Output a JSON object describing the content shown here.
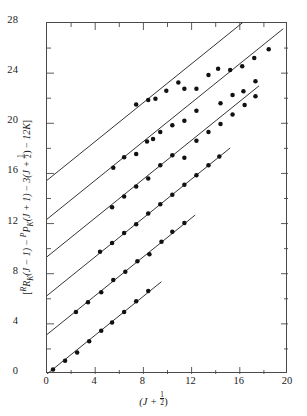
{
  "chart_data": {
    "type": "scatter",
    "title": "",
    "xlabel": "(J + 1/2)",
    "ylabel": "[ RR_K(J - 1) - PP_K(J + 1) - 3(J + 1/2) - 12K ]",
    "xlim": [
      0,
      20
    ],
    "ylim": [
      0,
      28
    ],
    "xticks": [
      0,
      4,
      8,
      12,
      16,
      20
    ],
    "yticks": [
      0,
      4,
      8,
      12,
      16,
      20,
      24,
      28
    ],
    "xminor_step": 2,
    "yminor_step": 2,
    "grid": false,
    "legend": false,
    "marker": "filled-circle",
    "series": [
      {
        "name": "K = 0",
        "intercept": 0.0,
        "slope": 0.775,
        "line_x": [
          0.0,
          9.5
        ],
        "points": [
          {
            "x": 0.5,
            "y": 0.35
          },
          {
            "x": 1.5,
            "y": 1.05
          },
          {
            "x": 2.5,
            "y": 1.72
          },
          {
            "x": 3.5,
            "y": 2.62
          },
          {
            "x": 4.5,
            "y": 3.45
          },
          {
            "x": 5.4,
            "y": 4.1
          },
          {
            "x": 6.4,
            "y": 4.95
          },
          {
            "x": 7.4,
            "y": 5.8
          },
          {
            "x": 8.4,
            "y": 6.62
          }
        ]
      },
      {
        "name": "K = 1",
        "intercept": 3.15,
        "slope": 0.775,
        "line_x": [
          0.0,
          12.3
        ],
        "points": [
          {
            "x": 2.4,
            "y": 4.95
          },
          {
            "x": 3.4,
            "y": 5.72
          },
          {
            "x": 4.5,
            "y": 6.52
          },
          {
            "x": 5.5,
            "y": 7.5
          },
          {
            "x": 6.5,
            "y": 8.15
          },
          {
            "x": 7.5,
            "y": 9.0
          },
          {
            "x": 8.5,
            "y": 9.55
          },
          {
            "x": 9.5,
            "y": 10.55
          },
          {
            "x": 10.4,
            "y": 11.35
          },
          {
            "x": 11.4,
            "y": 12.05
          }
        ]
      },
      {
        "name": "K = 2",
        "intercept": 6.25,
        "slope": 0.775,
        "line_x": [
          0.0,
          15.2
        ],
        "points": [
          {
            "x": 4.4,
            "y": 9.75
          },
          {
            "x": 5.4,
            "y": 10.45
          },
          {
            "x": 6.4,
            "y": 11.25
          },
          {
            "x": 7.4,
            "y": 11.95
          },
          {
            "x": 8.4,
            "y": 12.8
          },
          {
            "x": 9.4,
            "y": 13.55
          },
          {
            "x": 10.4,
            "y": 14.3
          },
          {
            "x": 11.4,
            "y": 15.1
          },
          {
            "x": 12.4,
            "y": 15.85
          },
          {
            "x": 13.4,
            "y": 16.65
          },
          {
            "x": 14.3,
            "y": 17.35
          }
        ]
      },
      {
        "name": "K = 3",
        "intercept": 9.35,
        "slope": 0.775,
        "line_x": [
          0.0,
          17.6
        ],
        "points": [
          {
            "x": 5.4,
            "y": 13.3
          },
          {
            "x": 6.4,
            "y": 14.15
          },
          {
            "x": 7.4,
            "y": 14.95
          },
          {
            "x": 8.4,
            "y": 15.6
          },
          {
            "x": 9.4,
            "y": 16.65
          },
          {
            "x": 10.4,
            "y": 17.45
          },
          {
            "x": 11.4,
            "y": 17.25
          },
          {
            "x": 12.4,
            "y": 18.6
          },
          {
            "x": 13.4,
            "y": 19.3
          },
          {
            "x": 14.4,
            "y": 19.95
          },
          {
            "x": 15.4,
            "y": 20.7
          },
          {
            "x": 16.4,
            "y": 21.45
          },
          {
            "x": 17.3,
            "y": 22.15
          }
        ]
      },
      {
        "name": "K = 4",
        "intercept": 12.35,
        "slope": 0.775,
        "line_x": [
          0.0,
          19.6
        ],
        "points": [
          {
            "x": 5.5,
            "y": 16.45
          },
          {
            "x": 6.4,
            "y": 17.3
          },
          {
            "x": 7.4,
            "y": 17.55
          },
          {
            "x": 8.3,
            "y": 18.55
          },
          {
            "x": 8.8,
            "y": 18.75
          },
          {
            "x": 9.4,
            "y": 19.3
          },
          {
            "x": 10.4,
            "y": 19.85
          },
          {
            "x": 11.4,
            "y": 20.2
          },
          {
            "x": 12.4,
            "y": 21.0
          },
          {
            "x": 14.4,
            "y": 21.6
          },
          {
            "x": 15.4,
            "y": 22.25
          },
          {
            "x": 16.3,
            "y": 22.55
          },
          {
            "x": 17.3,
            "y": 23.35
          }
        ]
      },
      {
        "name": "K = 5",
        "intercept": 15.45,
        "slope": 0.775,
        "line_x": [
          0.0,
          19.9
        ],
        "points": [
          {
            "x": 7.4,
            "y": 21.5
          },
          {
            "x": 8.4,
            "y": 21.85
          },
          {
            "x": 9.0,
            "y": 21.95
          },
          {
            "x": 9.9,
            "y": 22.6
          },
          {
            "x": 10.9,
            "y": 23.25
          },
          {
            "x": 11.4,
            "y": 22.75
          },
          {
            "x": 12.4,
            "y": 22.75
          },
          {
            "x": 13.4,
            "y": 23.85
          },
          {
            "x": 14.2,
            "y": 24.35
          },
          {
            "x": 15.2,
            "y": 24.25
          },
          {
            "x": 16.2,
            "y": 24.55
          },
          {
            "x": 17.2,
            "y": 25.2
          },
          {
            "x": 18.4,
            "y": 25.9
          }
        ]
      }
    ]
  },
  "axes": {
    "y_tick_labels": [
      "0",
      "4",
      "8",
      "12",
      "16",
      "20",
      "24",
      "28"
    ],
    "x_tick_labels": [
      "0",
      "4",
      "8",
      "12",
      "16",
      "20"
    ]
  },
  "style": {
    "line_color": "#2a2a2a",
    "marker_color": "#111111",
    "frame_color": "#4a4a4a",
    "background": "#ffffff"
  },
  "ytitle_parts": {
    "open": "[",
    "t1_sup": "R",
    "t1_main": "R",
    "t1_sub": "K",
    "t1_arg": "(J − 1)",
    "minus1": " − ",
    "t2_sup": "P",
    "t2_main": "P",
    "t2_sub": "K",
    "t2_arg": "(J + 1)",
    "minus2": " − ",
    "t3": "3(J + ",
    "t3_num": "1",
    "t3_den": "2",
    "t3_close": ")",
    "minus3": " − ",
    "t4": "12K",
    "close": "]"
  },
  "xtitle_parts": {
    "open": "(J + ",
    "num": "1",
    "den": "2",
    "close": ")"
  }
}
